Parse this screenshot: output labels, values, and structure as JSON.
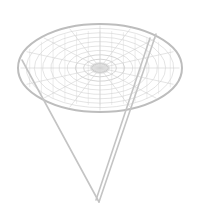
{
  "figure": {
    "type": "wireframe-cone",
    "colors": {
      "background": "#ffffff",
      "rim": "#bdbdbd",
      "mesh": "#d2d2d2",
      "mesh_dense": "#b8b8b8",
      "edges": "#c4c4c4"
    },
    "ellipse": {
      "cx": 100,
      "cy": 68,
      "rx": 82,
      "ry": 44
    },
    "apex": {
      "x": 99,
      "y": 202
    },
    "edges": [
      {
        "from": [
          22,
          60
        ],
        "to": [
          99,
          202
        ]
      },
      {
        "from": [
          156,
          34
        ],
        "to": [
          99,
          202
        ]
      },
      {
        "from": [
          150,
          38
        ],
        "to": [
          96,
          200
        ]
      }
    ],
    "mesh": {
      "rings": 9,
      "spokes": 16
    }
  }
}
